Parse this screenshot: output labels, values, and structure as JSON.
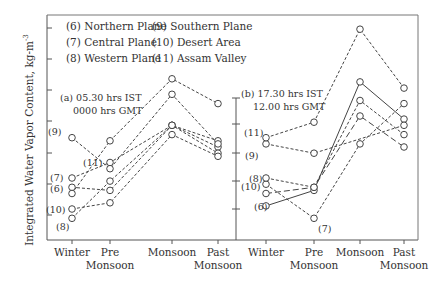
{
  "chart_data": {
    "type": "line",
    "ylabel": "Integrated Water Vapor Content, kg-m",
    "ylabel_sup": "-3",
    "categories": [
      "Winter",
      "Pre\nMonsoon",
      "Monsoon",
      "Past\nMonsoon"
    ],
    "category_lines": [
      [
        "Winter"
      ],
      [
        "Pre",
        "Monsoon"
      ],
      [
        "Monsoon"
      ],
      [
        "Past",
        "Monsoon"
      ]
    ],
    "legend": [
      "(6) Northern Plane",
      "(7) Central Plane",
      "(8) Western Plane",
      "(9) Southern Plane",
      "(10) Desert Area",
      "(11) Assam Valley"
    ],
    "units_note": "values in axis tick units (no numeric tick labels shown)",
    "panels": [
      {
        "title": "(a) 05.30 hrs IST",
        "subtitle": "0000 hrs GMT",
        "ylim": [
          0,
          7.3
        ],
        "series": [
          {
            "name": "(6)",
            "values": [
              1.7,
              1.6,
              3.7,
              3.0
            ]
          },
          {
            "name": "(7)",
            "values": [
              2.0,
              2.5,
              3.7,
              3.2
            ]
          },
          {
            "name": "(8)",
            "values": [
              0.7,
              1.9,
              3.7,
              2.8
            ]
          },
          {
            "name": "(9)",
            "values": [
              3.3,
              2.3,
              4.7,
              3.1
            ]
          },
          {
            "name": "(10)",
            "values": [
              1.0,
              1.2,
              3.4,
              2.7
            ]
          },
          {
            "name": "(11)",
            "values": [
              1.5,
              3.2,
              5.2,
              4.4
            ]
          }
        ]
      },
      {
        "title": "(b) 17.30 hrs IST",
        "subtitle": "12.00 hrs GMT",
        "ylim": [
          0,
          7.3
        ],
        "series": [
          {
            "name": "(6)",
            "values": [
              1.1,
              1.6,
              5.1,
              3.9
            ],
            "style": "solid"
          },
          {
            "name": "(7)",
            "values": [
              1.8,
              0.7,
              3.1,
              4.4
            ]
          },
          {
            "name": "(8)",
            "values": [
              2.0,
              1.7,
              4.5,
              3.4
            ]
          },
          {
            "name": "(9)",
            "values": [
              3.1,
              2.8,
              null,
              3.7
            ]
          },
          {
            "name": "(10)",
            "values": [
              1.5,
              1.7,
              4.0,
              3.0
            ],
            "style": "longdash"
          },
          {
            "name": "(11)",
            "values": [
              3.3,
              3.8,
              6.8,
              4.9
            ]
          }
        ]
      }
    ]
  }
}
